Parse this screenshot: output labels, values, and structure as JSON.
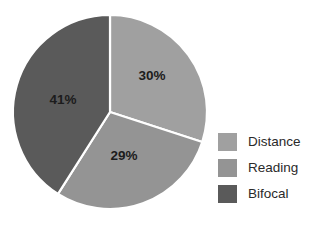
{
  "chart_data": {
    "type": "pie",
    "title": "",
    "subtitle": "",
    "xlabel": "",
    "ylabel": "",
    "categories": [
      "Distance",
      "Reading",
      "Bifocal"
    ],
    "values": [
      30,
      29,
      41
    ],
    "value_labels": [
      "30%",
      "29%",
      "41%"
    ],
    "colors": [
      "#a0a0a0",
      "#949494",
      "#5a5a5a"
    ],
    "legend_position": "right",
    "grid": false,
    "slice_separator_color": "#ffffff",
    "start_angle_deg": 0,
    "direction": "clockwise",
    "background": "#ffffff",
    "label_color": "#1c1c1c",
    "slices": [
      {
        "name": "Distance",
        "value": 30,
        "label": "30%",
        "color": "#a0a0a0",
        "label_x": 152,
        "label_y": 76
      },
      {
        "name": "Reading",
        "value": 29,
        "label": "29%",
        "color": "#949494",
        "label_x": 124,
        "label_y": 156
      },
      {
        "name": "Bifocal",
        "value": 41,
        "label": "41%",
        "color": "#5a5a5a",
        "label_x": 63,
        "label_y": 100
      }
    ]
  },
  "legend": {
    "items": [
      {
        "label": "Distance",
        "color": "#a0a0a0"
      },
      {
        "label": "Reading",
        "color": "#949494"
      },
      {
        "label": "Bifocal",
        "color": "#5a5a5a"
      }
    ]
  }
}
